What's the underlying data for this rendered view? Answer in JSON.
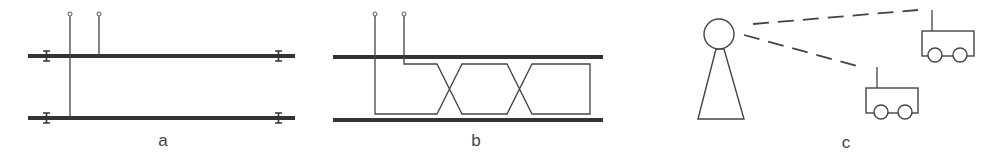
{
  "figure": {
    "panels": [
      {
        "id": "a",
        "label": "a",
        "description": "Two parallel conductors with I-shaped end markers; two terminals, one connected to top conductor, one spanning to bottom conductor"
      },
      {
        "id": "b",
        "label": "b",
        "description": "Two parallel conductors with a twisted pair loop crossing twice between them, fed by two terminals"
      },
      {
        "id": "c",
        "label": "c",
        "description": "A person figure with dashed lines of sight to two wheeled robots with antennas"
      }
    ],
    "colors": {
      "background": "#ffffff",
      "stroke": "#444444",
      "bar": "#333333",
      "label": "#444444"
    }
  }
}
